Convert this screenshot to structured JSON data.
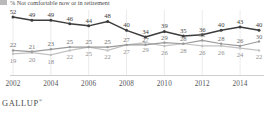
{
  "legend": {
    "swatch_color": "#b9b9b9",
    "label": "% Not comfortable now or in retirement"
  },
  "footer": {
    "brand": "GALLUP",
    "mark": "®"
  },
  "chart_data": {
    "type": "line",
    "title": "",
    "subtitle": "",
    "xlabel": "",
    "ylabel": "",
    "grid": false,
    "legend_position": "top-left",
    "ylim": [
      0,
      60
    ],
    "xlim": [
      2002,
      2015
    ],
    "x": [
      2002,
      2003,
      2004,
      2005,
      2006,
      2007,
      2008,
      2009,
      2010,
      2011,
      2012,
      2013,
      2014,
      2015
    ],
    "tick_labels": [
      "2002",
      "2004",
      "2006",
      "2008",
      "2010",
      "2012",
      "2014"
    ],
    "tick_values": [
      2002,
      2004,
      2006,
      2008,
      2010,
      2012,
      2014
    ],
    "series": [
      {
        "name": "Comfortable now and in retirement",
        "color": "#3d3d3d",
        "label_position": "above",
        "values": [
          52,
          49,
          49,
          46,
          44,
          48,
          40,
          34,
          39,
          35,
          36,
          40,
          43,
          40
        ]
      },
      {
        "name": "Not comfortable now but will be in retirement",
        "color": "#9a9a9a",
        "label_position": "above",
        "values": [
          22,
          21,
          23,
          25,
          25,
          25,
          27,
          27,
          29,
          28,
          31,
          28,
          26,
          30
        ]
      },
      {
        "name": "Not comfortable now or in retirement",
        "color": "#c2c2c2",
        "label_position": "below",
        "values": [
          19,
          20,
          18,
          22,
          25,
          22,
          27,
          29,
          26,
          28,
          26,
          26,
          24,
          22
        ]
      }
    ]
  }
}
